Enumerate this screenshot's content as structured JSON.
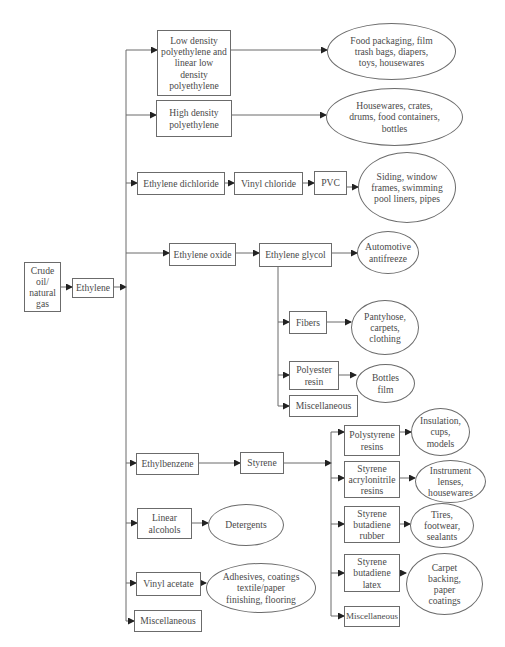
{
  "diagram": {
    "colors": {
      "stroke": "#6b6b6b",
      "text": "#4a4a4a",
      "background": "#ffffff"
    },
    "nodes": {
      "crude": "Crude\noil/\nnatural\ngas",
      "ethylene": "Ethylene",
      "ldpe": "Low density\npolyethylene and\nlinear low\ndensity\npolyethylene",
      "ldpe_use": "Food packaging, film\ntrash bags, diapers,\ntoys, housewares",
      "hdpe": "High density\npolyethylene",
      "hdpe_use": "Housewares, crates,\ndrums, food containers,\nbottles",
      "edc": "Ethylene dichloride",
      "vcm": "Vinyl chloride",
      "pvc": "PVC",
      "pvc_use": "Siding, window\nframes, swimming\npool liners, pipes",
      "eo": "Ethylene oxide",
      "eg": "Ethylene glycol",
      "eg_use": "Automotive\nantifreeze",
      "fibers": "Fibers",
      "fibers_use": "Pantyhose,\ncarpets,\nclothing",
      "polyester": "Polyester\nresin",
      "polyester_use": "Bottles\nfilm",
      "eg_misc": "Miscellaneous",
      "ethylbenzene": "Ethylbenzene",
      "styrene": "Styrene",
      "ps": "Polystyrene\nresins",
      "ps_use": "Insulation,\ncups,\nmodels",
      "san": "Styrene\nacrylonitrile\nresins",
      "san_use": "Instrument\nlenses,\nhousewares",
      "sbr": "Styrene\nbutadiene\nrubber",
      "sbr_use": "Tires,\nfootwear,\nsealants",
      "sbl": "Styrene\nbutadiene\nlatex",
      "sbl_use": "Carpet\nbacking,\npaper\ncoatings",
      "styrene_misc": "Miscellaneous",
      "alcohols": "Linear\nalcohols",
      "alcohols_use": "Detergents",
      "vam": "Vinyl acetate",
      "vam_use": "Adhesives, coatings\ntextile/paper\nfinishing, flooring",
      "ethylene_misc": "Miscellaneous"
    }
  }
}
